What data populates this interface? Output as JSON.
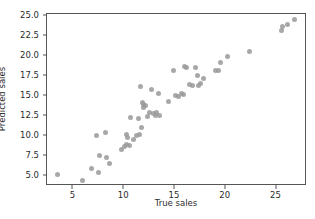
{
  "chart_data": {
    "type": "scatter",
    "title": "",
    "xlabel": "True sales",
    "ylabel": "Predicted sales",
    "xlim": [
      2.4,
      28.0
    ],
    "ylim": [
      3.8,
      25.3
    ],
    "xticks": [
      5,
      10,
      15,
      20,
      25
    ],
    "xticklabels": [
      "5",
      "10",
      "15",
      "20",
      "25"
    ],
    "yticks": [
      5.0,
      7.5,
      10.0,
      12.5,
      15.0,
      17.5,
      20.0,
      22.5,
      25.0
    ],
    "yticklabels": [
      "5.0",
      "7.5",
      "10.0",
      "12.5",
      "15.0",
      "17.5",
      "20.0",
      "22.5",
      "25.0"
    ],
    "grid": false,
    "legend": null,
    "marker": {
      "color": "#999999",
      "shape": "circle",
      "size": 5,
      "opacity": 0.85
    },
    "series": [
      {
        "name": "predictions",
        "points": [
          [
            3.4,
            5.3
          ],
          [
            5.9,
            4.5
          ],
          [
            6.8,
            6.0
          ],
          [
            7.3,
            10.1
          ],
          [
            7.6,
            7.6
          ],
          [
            7.5,
            5.5
          ],
          [
            8.2,
            10.5
          ],
          [
            8.3,
            7.4
          ],
          [
            8.6,
            6.6
          ],
          [
            9.7,
            8.4
          ],
          [
            10.0,
            8.7
          ],
          [
            10.2,
            10.2
          ],
          [
            10.3,
            9.9
          ],
          [
            10.2,
            9.0
          ],
          [
            10.5,
            8.9
          ],
          [
            10.6,
            12.4
          ],
          [
            10.9,
            9.6
          ],
          [
            11.2,
            10.1
          ],
          [
            11.4,
            12.3
          ],
          [
            11.5,
            10.3
          ],
          [
            11.6,
            16.3
          ],
          [
            11.7,
            11.1
          ],
          [
            11.8,
            14.3
          ],
          [
            11.9,
            14.0
          ],
          [
            11.9,
            13.6
          ],
          [
            12.1,
            13.9
          ],
          [
            12.3,
            12.5
          ],
          [
            12.5,
            13.0
          ],
          [
            12.7,
            15.9
          ],
          [
            12.9,
            12.9
          ],
          [
            13.1,
            12.6
          ],
          [
            13.2,
            13.0
          ],
          [
            13.4,
            15.4
          ],
          [
            13.5,
            12.6
          ],
          [
            14.4,
            14.4
          ],
          [
            14.9,
            18.3
          ],
          [
            15.1,
            15.1
          ],
          [
            15.3,
            15.0
          ],
          [
            15.6,
            15.4
          ],
          [
            15.8,
            15.3
          ],
          [
            15.9,
            18.8
          ],
          [
            16.1,
            18.6
          ],
          [
            16.4,
            16.5
          ],
          [
            16.7,
            16.4
          ],
          [
            17.0,
            18.6
          ],
          [
            17.2,
            17.6
          ],
          [
            17.3,
            16.4
          ],
          [
            17.5,
            16.6
          ],
          [
            17.8,
            17.2
          ],
          [
            19.0,
            18.2
          ],
          [
            19.3,
            18.3
          ],
          [
            19.5,
            19.2
          ],
          [
            20.2,
            20.0
          ],
          [
            22.3,
            20.6
          ],
          [
            25.5,
            23.3
          ],
          [
            25.6,
            23.7
          ],
          [
            26.1,
            24.0
          ],
          [
            26.8,
            24.6
          ]
        ]
      }
    ]
  }
}
